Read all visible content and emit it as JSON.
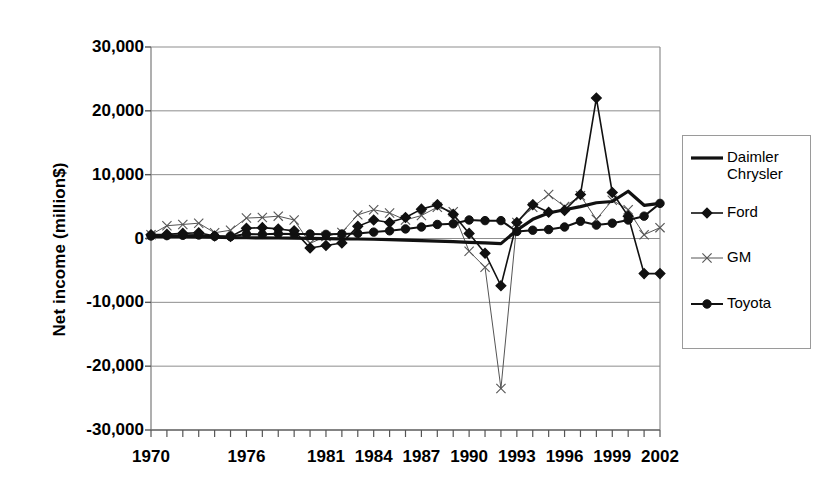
{
  "chart_data": {
    "type": "line",
    "title": "",
    "xlabel": "",
    "ylabel": "Net income (million$)",
    "ylim": [
      -30000,
      30000
    ],
    "ytick_labels": [
      "30,000",
      "20,000",
      "10,000",
      "0",
      "-10,000",
      "-20,000",
      "-30,000"
    ],
    "ytick_values": [
      30000,
      20000,
      10000,
      0,
      -10000,
      -20000,
      -30000
    ],
    "grid": true,
    "grid_axis": "y",
    "legend_position": "right",
    "xtick_labels": [
      "1970",
      "1976",
      "1981",
      "1984",
      "1987",
      "1990",
      "1993",
      "1996",
      "1999",
      "2002"
    ],
    "xtick_values": [
      1970,
      1976,
      1981,
      1984,
      1987,
      1990,
      1993,
      1996,
      1999,
      2002
    ],
    "x": [
      1970,
      1971,
      1972,
      1973,
      1974,
      1975,
      1976,
      1977,
      1978,
      1979,
      1980,
      1981,
      1982,
      1983,
      1984,
      1985,
      1986,
      1987,
      1988,
      1989,
      1990,
      1991,
      1992,
      1993,
      1994,
      1995,
      1996,
      1997,
      1998,
      1999,
      2000,
      2001,
      2002
    ],
    "series": [
      {
        "name": "Daimler Chrysler",
        "legend_label": "Daimler\nChrysler",
        "marker": "none",
        "line_width": 3.2,
        "color": "#111111",
        "values": [
          320,
          300,
          280,
          250,
          200,
          150,
          120,
          100,
          80,
          60,
          20,
          -20,
          -50,
          -80,
          -120,
          -180,
          -250,
          -320,
          -400,
          -500,
          -600,
          -700,
          -800,
          1300,
          3000,
          4000,
          4500,
          5000,
          5600,
          5800,
          7400,
          5200,
          5500
        ]
      },
      {
        "name": "Ford",
        "legend_label": "Ford",
        "marker": "diamond",
        "line_width": 1.6,
        "color": "#111111",
        "values": [
          600,
          650,
          800,
          900,
          400,
          300,
          1600,
          1700,
          1500,
          1200,
          -1500,
          -1100,
          -700,
          1900,
          2900,
          2500,
          3300,
          4600,
          5300,
          3800,
          800,
          -2300,
          -7400,
          2500,
          5300,
          4100,
          4400,
          6900,
          22000,
          7200,
          3500,
          -5500,
          -5500
        ]
      },
      {
        "name": "GM",
        "legend_label": "GM",
        "marker": "x",
        "line_width": 1.0,
        "color": "#555555",
        "values": [
          600,
          2000,
          2200,
          2400,
          900,
          1300,
          3200,
          3300,
          3500,
          2900,
          -760,
          330,
          960,
          3700,
          4500,
          4000,
          2900,
          3600,
          4900,
          4200,
          -2000,
          -4500,
          -23500,
          2500,
          4900,
          6900,
          5000,
          6700,
          3000,
          6000,
          4500,
          600,
          1700
        ]
      },
      {
        "name": "Toyota",
        "legend_label": "Toyota",
        "marker": "circle",
        "line_width": 2.0,
        "color": "#111111",
        "values": [
          400,
          450,
          500,
          550,
          350,
          300,
          700,
          650,
          750,
          700,
          700,
          650,
          700,
          800,
          1000,
          1200,
          1500,
          1800,
          2200,
          2300,
          2900,
          2800,
          2800,
          1100,
          1300,
          1400,
          1800,
          2700,
          2100,
          2400,
          2900,
          3500,
          5500
        ]
      }
    ]
  }
}
